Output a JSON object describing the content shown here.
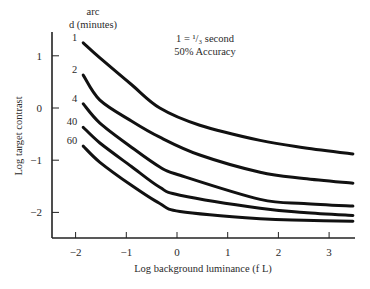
{
  "chart_data": {
    "type": "line",
    "title": "",
    "xlabel": "Log background luminance (f L)",
    "ylabel": "Log target contrast",
    "xlim": [
      -2.5,
      3.5
    ],
    "ylim": [
      -2.5,
      1.5
    ],
    "xticks": [
      -2,
      -1,
      0,
      1,
      2,
      3
    ],
    "yticks": [
      1,
      0,
      -1,
      -2
    ],
    "xtick_labels": [
      "−2",
      "−1",
      "0",
      "1",
      "2",
      "3"
    ],
    "ytick_labels": [
      "1",
      "0",
      "−1",
      "−2"
    ],
    "grid": false,
    "legend_title": [
      "arc",
      "d (minutes)"
    ],
    "annotations": [
      "1 = ¹/₃ second",
      "50% Accuracy"
    ],
    "series": [
      {
        "name": "1",
        "x": [
          -1.85,
          -1.52,
          -0.9,
          -0.34,
          0.45,
          1.64,
          2.5,
          3.47
        ],
        "y": [
          1.25,
          0.96,
          0.45,
          0.0,
          -0.33,
          -0.62,
          -0.76,
          -0.88
        ]
      },
      {
        "name": "2",
        "x": [
          -1.85,
          -1.52,
          -0.9,
          -0.34,
          0.45,
          1.64,
          2.5,
          3.47
        ],
        "y": [
          0.63,
          0.15,
          -0.25,
          -0.56,
          -0.9,
          -1.23,
          -1.35,
          -1.44
        ]
      },
      {
        "name": "4",
        "x": [
          -1.85,
          -1.52,
          -0.9,
          -0.34,
          0.06,
          1.64,
          2.5,
          3.47
        ],
        "y": [
          0.08,
          -0.29,
          -0.75,
          -1.13,
          -1.29,
          -1.75,
          -1.83,
          -1.88
        ]
      },
      {
        "name": "40",
        "x": [
          -1.85,
          -1.52,
          -0.9,
          -0.34,
          0.06,
          1.64,
          2.5,
          3.47
        ],
        "y": [
          -0.37,
          -0.67,
          -1.12,
          -1.52,
          -1.67,
          -1.92,
          -2.0,
          -2.06
        ]
      },
      {
        "name": "60",
        "x": [
          -1.85,
          -1.52,
          -0.9,
          -0.34,
          0.06,
          1.64,
          2.5,
          3.47
        ],
        "y": [
          -0.73,
          -1.04,
          -1.48,
          -1.83,
          -1.98,
          -2.12,
          -2.15,
          -2.17
        ]
      }
    ]
  }
}
